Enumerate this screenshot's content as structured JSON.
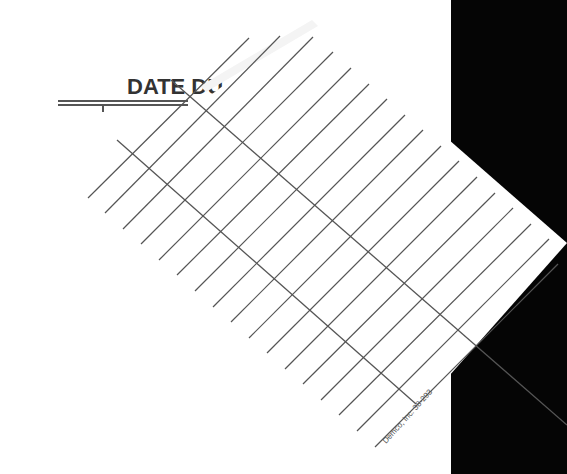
{
  "card_header": {
    "title": "DATE DU"
  },
  "card": {
    "columns": 3,
    "row_lines": 19,
    "imprint": "Demco, Inc. 38-293"
  },
  "colors": {
    "paper": "#ffffff",
    "ink": "#555555",
    "title_ink": "#333333",
    "background_right": "#050505"
  }
}
